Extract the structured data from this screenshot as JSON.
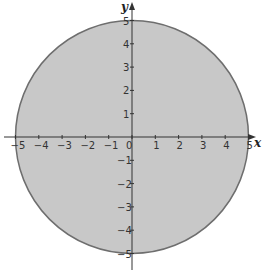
{
  "chart_data": {
    "type": "area",
    "title": "",
    "shape": {
      "kind": "circle",
      "center": [
        0,
        0
      ],
      "radius": 5,
      "filled": true
    },
    "xlabel": "x",
    "ylabel": "y",
    "xlim": [
      -5,
      5
    ],
    "ylim": [
      -5,
      5
    ],
    "x_ticks": [
      -5,
      -4,
      -3,
      -2,
      -1,
      0,
      1,
      2,
      3,
      4,
      5
    ],
    "y_ticks": [
      -5,
      -4,
      -3,
      -2,
      -1,
      1,
      2,
      3,
      4,
      5
    ],
    "x_tick_labels": [
      "-5",
      "-4",
      "-3",
      "-2",
      "-1",
      "0",
      "1",
      "2",
      "3",
      "4",
      "5"
    ],
    "y_tick_labels": [
      "-5",
      "-4",
      "-3",
      "-2",
      "-1",
      "1",
      "2",
      "3",
      "4",
      "5"
    ],
    "grid": false,
    "legend": null,
    "colors": {
      "fill": "#c8c8c8",
      "stroke": "#6e6e6e",
      "axis": "#333333"
    }
  }
}
